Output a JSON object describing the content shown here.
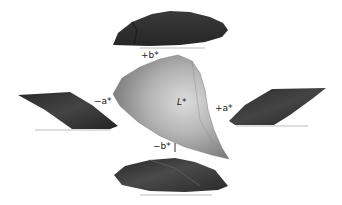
{
  "figure": {
    "axis_labels": {
      "plus_b": "+b*",
      "minus_b": "−b*",
      "plus_a": "+a*",
      "minus_a": "−a*",
      "lightness": "L*"
    },
    "colors": {
      "shadow_dark": "#2b2b2b",
      "shadow_mid": "#4a4a4a",
      "solid_light": "#c8c8c8",
      "solid_mid": "#9a9a9a",
      "solid_dark": "#6e6e6e",
      "baseline": "#bdbdbd"
    }
  }
}
